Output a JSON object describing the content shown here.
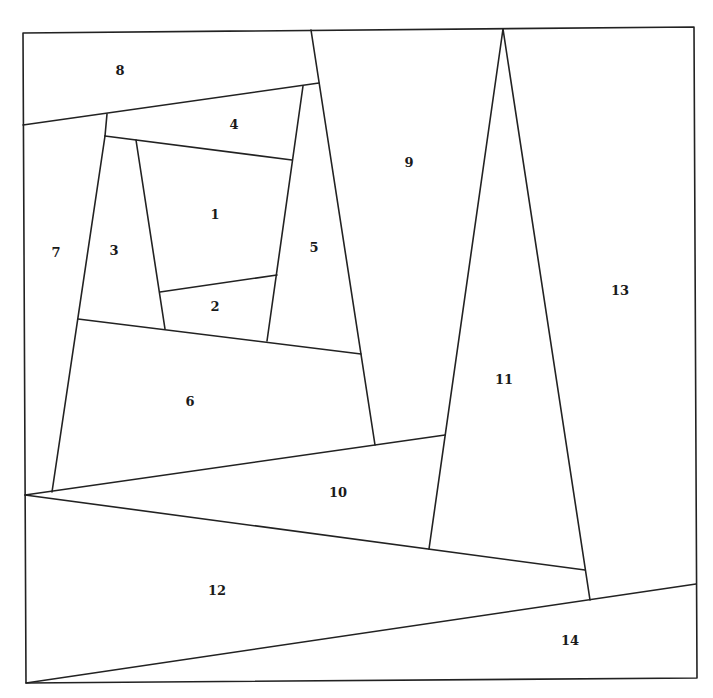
{
  "diagram": {
    "stroke_color": "#222222",
    "background": "#ffffff",
    "frame": [
      [
        23,
        33
      ],
      [
        694,
        27
      ],
      [
        697,
        678
      ],
      [
        26,
        683
      ]
    ],
    "segments": [
      {
        "id": "s8-bottom",
        "from": [
          23,
          125
        ],
        "to": [
          319,
          83
        ]
      },
      {
        "id": "s9-left",
        "from": [
          311,
          30
        ],
        "to": [
          375,
          445
        ]
      },
      {
        "id": "s4-top-left",
        "from": [
          107,
          114
        ],
        "to": [
          105,
          136
        ]
      },
      {
        "id": "s4-bottom",
        "from": [
          105,
          136
        ],
        "to": [
          292,
          160
        ]
      },
      {
        "id": "s5-left",
        "from": [
          303,
          86
        ],
        "to": [
          267,
          341
        ]
      },
      {
        "id": "s1-left",
        "from": [
          136,
          140
        ],
        "to": [
          165,
          329
        ]
      },
      {
        "id": "s1-bottom",
        "from": [
          160,
          292
        ],
        "to": [
          277,
          275
        ]
      },
      {
        "id": "s3-left",
        "from": [
          105,
          136
        ],
        "to": [
          52,
          492
        ]
      },
      {
        "id": "s6-top",
        "from": [
          78,
          319
        ],
        "to": [
          361,
          354
        ]
      },
      {
        "id": "s10-top",
        "from": [
          25,
          495
        ],
        "to": [
          445,
          435
        ]
      },
      {
        "id": "s10-bottom",
        "from": [
          25,
          495
        ],
        "to": [
          585,
          570
        ]
      },
      {
        "id": "s11-left",
        "from": [
          503,
          29
        ],
        "to": [
          429,
          549
        ]
      },
      {
        "id": "s11-right",
        "from": [
          503,
          29
        ],
        "to": [
          590,
          600
        ]
      },
      {
        "id": "s14-top",
        "from": [
          26,
          683
        ],
        "to": [
          696,
          584
        ]
      }
    ],
    "pieces": [
      {
        "number": "1",
        "x": 215,
        "y": 215
      },
      {
        "number": "2",
        "x": 215,
        "y": 307
      },
      {
        "number": "3",
        "x": 114,
        "y": 251
      },
      {
        "number": "4",
        "x": 234,
        "y": 125
      },
      {
        "number": "5",
        "x": 314,
        "y": 248
      },
      {
        "number": "6",
        "x": 190,
        "y": 402
      },
      {
        "number": "7",
        "x": 56,
        "y": 253
      },
      {
        "number": "8",
        "x": 120,
        "y": 71
      },
      {
        "number": "9",
        "x": 409,
        "y": 163
      },
      {
        "number": "10",
        "x": 338,
        "y": 493
      },
      {
        "number": "11",
        "x": 504,
        "y": 380
      },
      {
        "number": "12",
        "x": 217,
        "y": 591
      },
      {
        "number": "13",
        "x": 620,
        "y": 291
      },
      {
        "number": "14",
        "x": 570,
        "y": 641
      }
    ]
  }
}
